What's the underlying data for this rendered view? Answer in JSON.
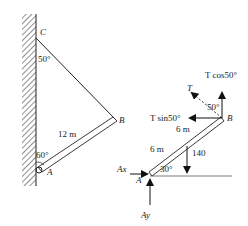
{
  "left_figure": {
    "point_c": "C",
    "point_b": "B",
    "point_a": "A",
    "angle_c": "50°",
    "angle_a": "60°",
    "beam_length": "12 m"
  },
  "right_figure": {
    "point_b": "B",
    "point_a": "A",
    "tension": "T",
    "t_cos": "T cos50°",
    "t_sin": "T sin50°",
    "angle_b": "50°",
    "upper_length": "6 m",
    "lower_length": "6 m",
    "load": "140",
    "angle_a": "30°",
    "ax": "Ax",
    "ay": "Ay"
  }
}
